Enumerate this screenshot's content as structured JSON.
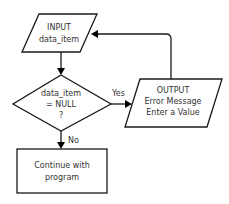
{
  "diagram": {
    "type": "flowchart",
    "nodes": {
      "input": {
        "shape": "parallelogram",
        "lines": [
          "INPUT",
          "data_item"
        ]
      },
      "decision": {
        "shape": "diamond",
        "lines": [
          "data_item",
          "= NULL",
          "?"
        ]
      },
      "output": {
        "shape": "parallelogram",
        "lines": [
          "OUTPUT",
          "Error Message",
          "Enter a Value"
        ]
      },
      "process": {
        "shape": "rectangle",
        "lines": [
          "Continue with",
          "program"
        ]
      }
    },
    "edges": {
      "yes_label": "Yes",
      "no_label": "No"
    },
    "colors": {
      "stroke": "#1a1a1a",
      "text": "#333333",
      "background": "#ffffff"
    }
  }
}
